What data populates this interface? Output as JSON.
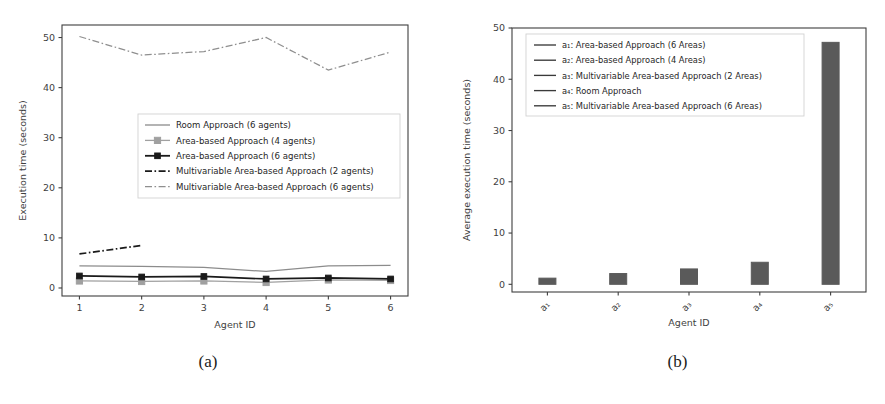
{
  "figure": {
    "captions": {
      "a": "(a)",
      "b": "(b)"
    }
  },
  "chart_data": [
    {
      "panel": "a",
      "type": "line",
      "title": "",
      "xlabel": "Agent ID",
      "ylabel": "Execution time (seconds)",
      "x": [
        1,
        2,
        3,
        4,
        5,
        6
      ],
      "xticklabels": [
        "1",
        "2",
        "3",
        "4",
        "5",
        "6"
      ],
      "yticklabels": [
        "0",
        "10",
        "20",
        "30",
        "40",
        "50"
      ],
      "xlim": [
        0.72,
        6.28
      ],
      "ylim": [
        -1.6,
        52.5
      ],
      "grid": false,
      "legend_position": "center",
      "series": [
        {
          "name": "Room Approach (6 agents)",
          "style": "solid",
          "marker": "none",
          "color": "#8c8c8c",
          "values": [
            4.4,
            4.3,
            4.1,
            3.3,
            4.4,
            4.5
          ]
        },
        {
          "name": "Area-based Approach (4 agents)",
          "style": "solid",
          "marker": "square",
          "color": "#a0a0a0",
          "values": [
            1.4,
            1.3,
            1.4,
            1.1,
            1.6,
            1.5
          ]
        },
        {
          "name": "Area-based Approach (6 agents)",
          "style": "solid",
          "marker": "square",
          "color": "#1a1a1a",
          "values": [
            2.4,
            2.2,
            2.3,
            1.8,
            2.0,
            1.8
          ]
        },
        {
          "name": "Multivariable Area-based Approach (2 agents)",
          "style": "dashdot",
          "marker": "none",
          "color": "#1a1a1a",
          "values": [
            6.8,
            8.5,
            null,
            null,
            null,
            null
          ]
        },
        {
          "name": "Multivariable Area-based Approach (6 agents)",
          "style": "dashdot",
          "marker": "none",
          "color": "#8f8f8f",
          "values": [
            50.2,
            46.5,
            47.2,
            50.0,
            43.5,
            47.1
          ]
        }
      ]
    },
    {
      "panel": "b",
      "type": "bar",
      "title": "",
      "xlabel": "Agent ID",
      "ylabel": "Average execution time (seconds)",
      "categories": [
        "a1",
        "a2",
        "a3",
        "a4",
        "a5"
      ],
      "xticklabels": [
        "a₁",
        "a₂",
        "a₃",
        "a₄",
        "a₅"
      ],
      "yticklabels": [
        "0",
        "10",
        "20",
        "30",
        "40",
        "50"
      ],
      "ylim": [
        -1.5,
        50
      ],
      "grid": false,
      "bar_color": "#5a5a5a",
      "values": [
        1.2,
        2.1,
        3.0,
        4.3,
        47.2
      ],
      "legend_position": "upper left",
      "legend": [
        {
          "key": "a₁",
          "label": "Area-based Approach",
          "suffix": "(6 Areas)",
          "color": "#3a3a3a"
        },
        {
          "key": "a₂",
          "label": "Area-based Approach",
          "suffix": "(4 Areas)",
          "color": "#3a3a3a"
        },
        {
          "key": "a₃",
          "label": "Multivariable Area-based Approach",
          "suffix": "(2 Areas)",
          "color": "#3a3a3a"
        },
        {
          "key": "a₄",
          "label": "Room Approach",
          "suffix": "",
          "color": "#3a3a3a"
        },
        {
          "key": "a₅",
          "label": "Multivariable Area-based Approach",
          "suffix": "(6 Areas)",
          "color": "#3a3a3a"
        }
      ]
    }
  ]
}
